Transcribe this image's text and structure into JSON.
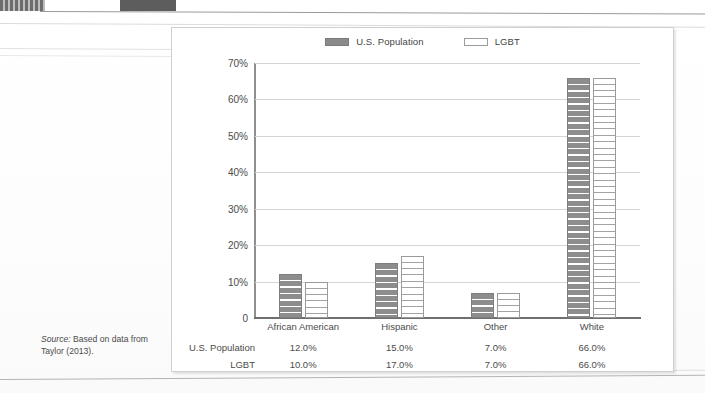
{
  "page": {
    "source_note_prefix": "Source:",
    "source_note_text": " Based on data from Taylor (2013)."
  },
  "chart_data": {
    "type": "bar",
    "title": "",
    "subtitle": "",
    "xlabel": "",
    "ylabel": "",
    "categories": [
      "African American",
      "Hispanic",
      "Other",
      "White"
    ],
    "series": [
      {
        "name": "U.S. Population",
        "values": [
          12.0,
          15.0,
          7.0,
          66.0
        ],
        "swatch": "filled",
        "color": "#8a8a8a"
      },
      {
        "name": "LGBT",
        "values": [
          10.0,
          17.0,
          7.0,
          66.0
        ],
        "swatch": "hollow",
        "color": "#ffffff"
      }
    ],
    "ylim": [
      0,
      70
    ],
    "ytick_values": [
      70,
      60,
      50,
      40,
      30,
      20,
      10,
      0
    ],
    "ytick_labels": [
      "70%",
      "60%",
      "50%",
      "40%",
      "30%",
      "20%",
      "10%",
      "0"
    ],
    "grid": true,
    "legend_position": "top-center",
    "value_suffix": "%",
    "data_table": {
      "row_labels": [
        "U.S. Population",
        "LGBT"
      ],
      "rows": [
        [
          "12.0%",
          "15.0%",
          "7.0%",
          "66.0%"
        ],
        [
          "10.0%",
          "17.0%",
          "7.0%",
          "66.0%"
        ]
      ]
    }
  }
}
